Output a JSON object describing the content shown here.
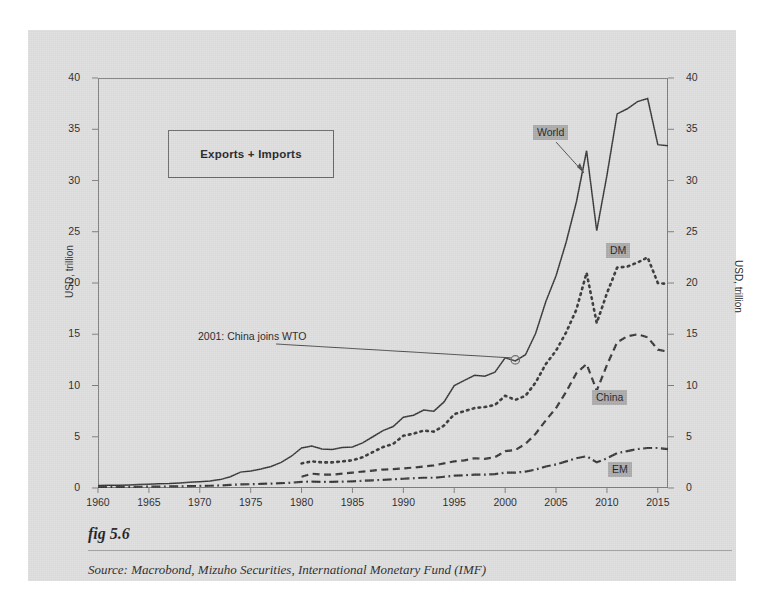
{
  "figure": {
    "caption": "fig 5.6",
    "source": "Source:  Macrobond, Mizuho Securities, International Monetary Fund (IMF)",
    "legend_title": "Exports + Imports",
    "annotation": "2001: China joins WTO"
  },
  "axis": {
    "left_title": "USD, trillion",
    "right_title": "USD, trillion",
    "yticks": [
      "40",
      "35",
      "30",
      "25",
      "20",
      "15",
      "10",
      "5",
      "0"
    ],
    "xticks": [
      "1960",
      "1965",
      "1970",
      "1975",
      "1980",
      "1985",
      "1990",
      "1995",
      "2000",
      "2005",
      "2010",
      "2015"
    ]
  },
  "series_tags": {
    "world": "World",
    "dm": "DM",
    "china": "China",
    "em": "EM"
  },
  "colors": {
    "card_background": "#dcdcdc",
    "page_background": "#ffffff",
    "line": "#333333",
    "frame": "#7a7a7a",
    "tag_background": "#a8a8a8",
    "text": "#1a1a1a"
  },
  "chart_data": {
    "type": "line",
    "title": "Exports + Imports",
    "xlabel": "",
    "ylabel": "USD, trillion",
    "xlim": [
      1960,
      2016
    ],
    "ylim": [
      0,
      40
    ],
    "grid": false,
    "legend_position": "inline-labels",
    "annotations": [
      {
        "text": "2001: China joins WTO",
        "x": 2001,
        "y": 12.5,
        "marker": "open-circle"
      }
    ],
    "x": [
      1960,
      1961,
      1962,
      1963,
      1964,
      1965,
      1966,
      1967,
      1968,
      1969,
      1970,
      1971,
      1972,
      1973,
      1974,
      1975,
      1976,
      1977,
      1978,
      1979,
      1980,
      1981,
      1982,
      1983,
      1984,
      1985,
      1986,
      1987,
      1988,
      1989,
      1990,
      1991,
      1992,
      1993,
      1994,
      1995,
      1996,
      1997,
      1998,
      1999,
      2000,
      2001,
      2002,
      2003,
      2004,
      2005,
      2006,
      2007,
      2008,
      2009,
      2010,
      2011,
      2012,
      2013,
      2014,
      2015,
      2016
    ],
    "series": [
      {
        "name": "World",
        "style": "solid",
        "values": [
          0.25,
          0.26,
          0.28,
          0.3,
          0.34,
          0.37,
          0.41,
          0.43,
          0.48,
          0.55,
          0.62,
          0.69,
          0.82,
          1.1,
          1.55,
          1.65,
          1.85,
          2.1,
          2.5,
          3.1,
          3.9,
          4.1,
          3.8,
          3.75,
          3.95,
          4.0,
          4.4,
          5.0,
          5.6,
          6.0,
          6.9,
          7.1,
          7.6,
          7.5,
          8.4,
          10.0,
          10.5,
          11.0,
          10.9,
          11.3,
          12.7,
          12.4,
          13.0,
          15.1,
          18.2,
          20.7,
          24.0,
          27.9,
          32.9,
          25.1,
          30.5,
          36.5,
          37.0,
          37.7,
          38.0,
          33.5,
          33.4
        ]
      },
      {
        "name": "DM",
        "style": "dotted",
        "values": [
          null,
          null,
          null,
          null,
          null,
          null,
          null,
          null,
          null,
          null,
          null,
          null,
          null,
          null,
          null,
          null,
          null,
          null,
          null,
          null,
          2.4,
          2.6,
          2.5,
          2.5,
          2.6,
          2.7,
          3.0,
          3.5,
          4.0,
          4.3,
          5.1,
          5.3,
          5.6,
          5.5,
          6.1,
          7.2,
          7.5,
          7.8,
          7.9,
          8.1,
          9.0,
          8.6,
          9.0,
          10.3,
          12.1,
          13.4,
          15.2,
          17.4,
          21.0,
          16.1,
          19.0,
          21.5,
          21.6,
          22.0,
          22.5,
          20.0,
          19.9
        ]
      },
      {
        "name": "China",
        "style": "dashed",
        "values": [
          null,
          null,
          null,
          null,
          null,
          null,
          null,
          null,
          null,
          null,
          null,
          null,
          null,
          null,
          null,
          null,
          null,
          null,
          null,
          null,
          1.1,
          1.4,
          1.3,
          1.3,
          1.4,
          1.5,
          1.6,
          1.7,
          1.8,
          1.85,
          1.9,
          2.0,
          2.1,
          2.2,
          2.4,
          2.6,
          2.7,
          2.9,
          2.85,
          3.0,
          3.6,
          3.7,
          4.3,
          5.3,
          6.6,
          7.8,
          9.4,
          11.2,
          12.1,
          9.5,
          12.0,
          14.2,
          14.8,
          15.0,
          14.7,
          13.5,
          13.3
        ]
      },
      {
        "name": "EM",
        "style": "dashdot",
        "values": [
          0.1,
          0.1,
          0.1,
          0.11,
          0.12,
          0.13,
          0.14,
          0.15,
          0.16,
          0.18,
          0.2,
          0.22,
          0.25,
          0.3,
          0.35,
          0.37,
          0.4,
          0.43,
          0.47,
          0.52,
          0.6,
          0.62,
          0.6,
          0.6,
          0.62,
          0.65,
          0.7,
          0.75,
          0.8,
          0.85,
          0.9,
          0.95,
          1.0,
          1.0,
          1.1,
          1.2,
          1.25,
          1.3,
          1.3,
          1.35,
          1.5,
          1.5,
          1.6,
          1.8,
          2.1,
          2.3,
          2.6,
          2.9,
          3.1,
          2.5,
          2.9,
          3.4,
          3.6,
          3.8,
          3.9,
          3.9,
          3.8
        ]
      }
    ]
  }
}
